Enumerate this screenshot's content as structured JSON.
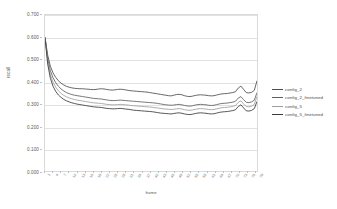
{
  "chart_data": {
    "type": "line",
    "title": "",
    "xlabel": "frame",
    "ylabel": "recall",
    "ylim": [
      0.0,
      0.7
    ],
    "ytick_labels": [
      "0.700",
      "0.600",
      "0.500",
      "0.400",
      "0.300",
      "0.200",
      "0.100",
      "0.000"
    ],
    "ytick_values": [
      0.7,
      0.6,
      0.5,
      0.4,
      0.3,
      0.2,
      0.1,
      0.0
    ],
    "grid": true,
    "legend_position": "right",
    "x": [
      0,
      1,
      2,
      3,
      4,
      5,
      6,
      7,
      8,
      9,
      10,
      11,
      12,
      13,
      14,
      15,
      16,
      17,
      18,
      19,
      20,
      21,
      22,
      23,
      24,
      25,
      26,
      27,
      28,
      29,
      30,
      31,
      32,
      33,
      34,
      35,
      36,
      37,
      38,
      39,
      40,
      41,
      42,
      43,
      44,
      45,
      46,
      47,
      48,
      49,
      50,
      51,
      52,
      53,
      54,
      55,
      56,
      57,
      58,
      59,
      60,
      61,
      62,
      63,
      64,
      65,
      66,
      67,
      68,
      69,
      70,
      71,
      72,
      73,
      74,
      75,
      76,
      77,
      78,
      79
    ],
    "xtick_labels": [
      "1",
      "4",
      "7",
      "10",
      "13",
      "16",
      "19",
      "22",
      "25",
      "28",
      "31",
      "34",
      "37",
      "40",
      "43",
      "46",
      "49",
      "52",
      "55",
      "58",
      "61",
      "64",
      "67",
      "70",
      "73",
      "76",
      "79"
    ],
    "series": [
      {
        "name": "config_2",
        "color": "#4d4d4d",
        "values": [
          0.6,
          0.52,
          0.47,
          0.44,
          0.42,
          0.405,
          0.394,
          0.386,
          0.38,
          0.376,
          0.373,
          0.371,
          0.37,
          0.369,
          0.369,
          0.368,
          0.367,
          0.366,
          0.365,
          0.366,
          0.368,
          0.369,
          0.368,
          0.366,
          0.364,
          0.363,
          0.364,
          0.366,
          0.367,
          0.366,
          0.364,
          0.362,
          0.36,
          0.359,
          0.358,
          0.357,
          0.356,
          0.355,
          0.354,
          0.352,
          0.35,
          0.348,
          0.346,
          0.344,
          0.342,
          0.34,
          0.338,
          0.337,
          0.34,
          0.343,
          0.344,
          0.342,
          0.338,
          0.335,
          0.334,
          0.336,
          0.339,
          0.341,
          0.342,
          0.341,
          0.34,
          0.338,
          0.337,
          0.338,
          0.341,
          0.344,
          0.346,
          0.347,
          0.348,
          0.35,
          0.352,
          0.356,
          0.372,
          0.381,
          0.366,
          0.352,
          0.35,
          0.353,
          0.362,
          0.405
        ]
      },
      {
        "name": "config_2_finetuned",
        "color": "#5e5e5e",
        "values": [
          0.6,
          0.505,
          0.45,
          0.418,
          0.396,
          0.38,
          0.368,
          0.359,
          0.352,
          0.347,
          0.343,
          0.34,
          0.338,
          0.336,
          0.334,
          0.332,
          0.33,
          0.328,
          0.326,
          0.325,
          0.324,
          0.323,
          0.321,
          0.319,
          0.317,
          0.316,
          0.316,
          0.317,
          0.318,
          0.317,
          0.316,
          0.315,
          0.314,
          0.313,
          0.312,
          0.311,
          0.31,
          0.309,
          0.308,
          0.307,
          0.306,
          0.305,
          0.303,
          0.301,
          0.299,
          0.297,
          0.296,
          0.295,
          0.296,
          0.298,
          0.299,
          0.297,
          0.294,
          0.292,
          0.291,
          0.293,
          0.296,
          0.298,
          0.299,
          0.298,
          0.297,
          0.295,
          0.294,
          0.295,
          0.298,
          0.301,
          0.303,
          0.304,
          0.305,
          0.307,
          0.309,
          0.313,
          0.327,
          0.334,
          0.32,
          0.308,
          0.307,
          0.31,
          0.318,
          0.352
        ]
      },
      {
        "name": "config_5",
        "color": "#9e9e9e",
        "values": [
          0.598,
          0.492,
          0.432,
          0.398,
          0.376,
          0.36,
          0.348,
          0.339,
          0.333,
          0.328,
          0.324,
          0.321,
          0.318,
          0.316,
          0.314,
          0.312,
          0.31,
          0.308,
          0.306,
          0.305,
          0.304,
          0.303,
          0.301,
          0.299,
          0.298,
          0.297,
          0.297,
          0.298,
          0.299,
          0.298,
          0.297,
          0.296,
          0.294,
          0.293,
          0.292,
          0.291,
          0.29,
          0.289,
          0.288,
          0.287,
          0.286,
          0.284,
          0.283,
          0.281,
          0.279,
          0.278,
          0.277,
          0.276,
          0.277,
          0.279,
          0.28,
          0.278,
          0.275,
          0.273,
          0.272,
          0.274,
          0.277,
          0.279,
          0.28,
          0.279,
          0.278,
          0.276,
          0.275,
          0.276,
          0.279,
          0.282,
          0.284,
          0.285,
          0.286,
          0.288,
          0.29,
          0.294,
          0.308,
          0.315,
          0.301,
          0.289,
          0.288,
          0.291,
          0.299,
          0.335
        ]
      },
      {
        "name": "config_5_finetuned",
        "color": "#3a3a3a",
        "values": [
          0.598,
          0.48,
          0.416,
          0.38,
          0.357,
          0.341,
          0.33,
          0.321,
          0.315,
          0.31,
          0.306,
          0.303,
          0.3,
          0.298,
          0.296,
          0.294,
          0.292,
          0.29,
          0.288,
          0.287,
          0.286,
          0.285,
          0.283,
          0.281,
          0.28,
          0.279,
          0.279,
          0.28,
          0.281,
          0.28,
          0.278,
          0.277,
          0.275,
          0.273,
          0.272,
          0.271,
          0.27,
          0.269,
          0.268,
          0.267,
          0.266,
          0.264,
          0.262,
          0.26,
          0.259,
          0.258,
          0.257,
          0.256,
          0.258,
          0.26,
          0.261,
          0.259,
          0.256,
          0.254,
          0.253,
          0.255,
          0.258,
          0.26,
          0.261,
          0.26,
          0.259,
          0.257,
          0.256,
          0.257,
          0.26,
          0.263,
          0.265,
          0.266,
          0.267,
          0.269,
          0.271,
          0.275,
          0.289,
          0.297,
          0.283,
          0.27,
          0.269,
          0.272,
          0.28,
          0.312
        ]
      }
    ]
  },
  "legend": {
    "items": [
      {
        "label": "config_2"
      },
      {
        "label": "config_2_finetuned"
      },
      {
        "label": "config_5"
      },
      {
        "label": "config_5_finetuned"
      }
    ]
  }
}
